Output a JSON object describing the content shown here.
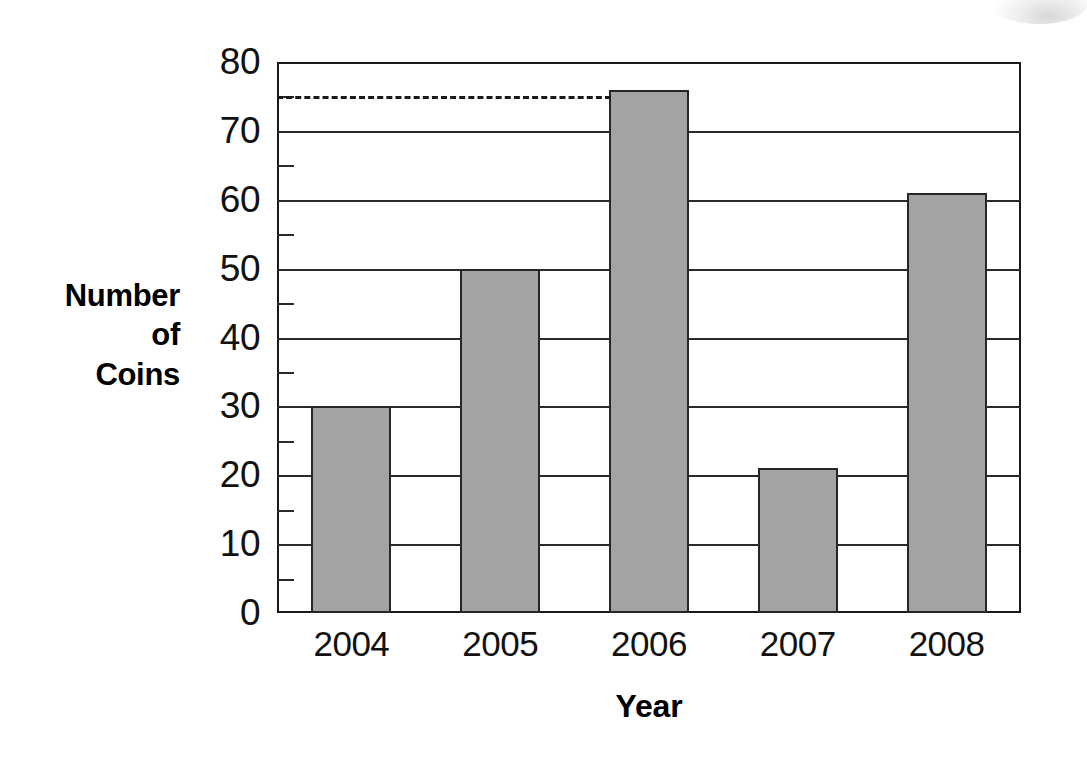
{
  "chart_data": {
    "type": "bar",
    "title": "",
    "categories": [
      "2004",
      "2005",
      "2006",
      "2007",
      "2008"
    ],
    "values": [
      30,
      50,
      76,
      21,
      61
    ],
    "series_name": "Number of Coins",
    "xlabel": "Year",
    "ylabel": "Number of Coins",
    "ylabel_lines": [
      "Number",
      "of",
      "Coins"
    ],
    "ylim": [
      0,
      80
    ],
    "ytick_step": 10,
    "yticks": [
      0,
      10,
      20,
      30,
      40,
      50,
      60,
      70,
      80
    ],
    "ytick_labels": [
      "0",
      "10",
      "20",
      "30",
      "40",
      "50",
      "60",
      "70",
      "80"
    ],
    "minor_tick_step": 5,
    "minor_ticks": [
      5,
      15,
      25,
      35,
      45,
      55,
      65,
      75
    ],
    "grid": true,
    "legend": "none",
    "annotations": [
      {
        "name": "threshold-dashed-line",
        "type": "horizontal-dashed-line",
        "value": 75,
        "from_category": "axis",
        "to_category": "2006"
      }
    ],
    "bar_fill_color": "#a3a3a3",
    "bar_outline_color": "#262626",
    "axis_color": "#1a1a1a"
  }
}
